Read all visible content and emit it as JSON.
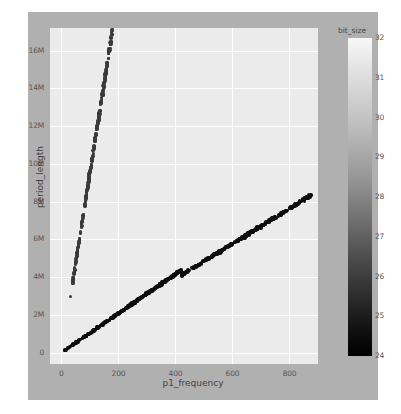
{
  "chart_data": {
    "type": "scatter",
    "title": "",
    "xlabel": "p1_frequency",
    "ylabel": "period_length",
    "xlim": [
      -40,
      900
    ],
    "ylim": [
      -600000,
      17200000
    ],
    "grid": true,
    "xticks": [
      0,
      200,
      400,
      600,
      800
    ],
    "xticklabels": [
      "0",
      "200",
      "400",
      "600",
      "800"
    ],
    "yticks": [
      0,
      2000000,
      4000000,
      6000000,
      8000000,
      10000000,
      12000000,
      14000000,
      16000000
    ],
    "yticklabels": [
      "0",
      "2M",
      "4M",
      "6M",
      "8M",
      "10M",
      "12M",
      "14M",
      "16M"
    ],
    "colorbar": {
      "label": "bit_size",
      "position": "right",
      "vmin": 24,
      "vmax": 32,
      "ticks": [
        32,
        31,
        30,
        29,
        28,
        27,
        26,
        25,
        24
      ],
      "ticklabels": [
        "32",
        "31",
        "30",
        "29",
        "28",
        "27",
        "26",
        "25",
        "24"
      ],
      "colormap": "gray_r_top_light"
    },
    "series": [
      {
        "name": "steep-branch",
        "color_value_range": [
          27,
          30
        ],
        "marker_color": "#3a3a3a",
        "x_range": [
          30,
          185
        ],
        "y_range": [
          700000,
          16500000
        ],
        "n_points": 300
      },
      {
        "name": "lower-branch",
        "color_value_range": [
          24,
          26
        ],
        "marker_color": "#0d0d0d",
        "x_range": [
          10,
          420
        ],
        "y_range": [
          100000,
          4500000
        ],
        "n_points": 320
      },
      {
        "name": "upper-right-branch",
        "color_value_range": [
          24,
          26
        ],
        "marker_color": "#0d0d0d",
        "x_range": [
          420,
          875
        ],
        "y_range": [
          4200000,
          8400000
        ],
        "n_points": 300
      }
    ]
  },
  "figure": {
    "background_color": "#b0b0b0",
    "panel_color": "#ebebeb",
    "gridline_color": "#ffffff"
  }
}
